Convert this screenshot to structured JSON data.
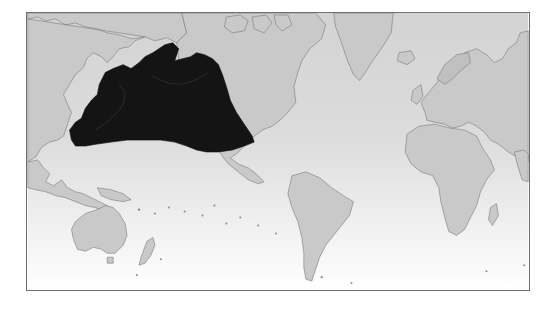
{
  "map": {
    "type": "world-distribution-map",
    "projection": "mercator-pacific-centered-left",
    "colors": {
      "land": "#c9c9c9",
      "coast": "#7a7a7a",
      "ocean_top": "#d3d3d3",
      "ocean_bottom": "#ffffff",
      "range": "#141414",
      "frame": "#6e6e6e"
    },
    "range": {
      "label": "North Pacific distribution range",
      "regions": [
        "Japan",
        "Sea of Okhotsk",
        "Kamchatka",
        "Bering Sea",
        "Gulf of Alaska",
        "North Pacific Ocean",
        "Baja California"
      ]
    },
    "landmasses": [
      "Asia",
      "Australia",
      "New Zealand",
      "North America",
      "Greenland",
      "South America",
      "Europe",
      "Africa",
      "Madagascar",
      "Iceland"
    ]
  }
}
